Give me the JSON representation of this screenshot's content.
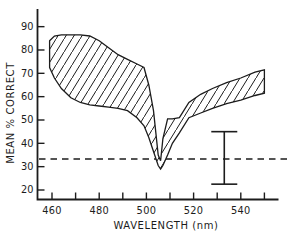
{
  "figure": {
    "background": "#ffffff",
    "ink_color": "#1c1c1c",
    "xlabel": "WAVELENGTH (nm)",
    "ylabel": "MEAN % CORRECT"
  },
  "chart_data": {
    "type": "area",
    "subtype": "hatched-band-between-two-curves",
    "title": "",
    "xlabel": "WAVELENGTH (nm)",
    "ylabel": "MEAN % CORRECT",
    "x_unit": "nm",
    "y_unit": "percent correct",
    "xlim": [
      454,
      556
    ],
    "ylim": [
      16,
      97
    ],
    "grid": "off",
    "x_ticks": [
      460,
      470,
      480,
      490,
      500,
      510,
      520,
      530,
      540,
      550
    ],
    "x_tick_labels": [
      460,
      480,
      500,
      520,
      540
    ],
    "y_ticks": [
      20,
      30,
      40,
      50,
      60,
      70,
      80,
      90
    ],
    "band": {
      "description": "hatched region between upper and lower percent-correct curves",
      "hatch_direction": "forward-slash",
      "x": [
        459,
        461,
        464,
        468,
        472,
        476,
        480,
        484,
        488,
        492,
        496,
        499,
        501,
        503,
        505,
        506,
        507,
        509,
        511,
        514,
        518,
        523,
        528,
        534,
        540,
        546,
        550
      ],
      "upper": [
        84,
        86,
        86.5,
        86.5,
        86.5,
        86,
        84,
        81,
        78,
        76,
        74,
        72.5,
        65,
        54,
        35,
        32.5,
        42,
        50.5,
        50.5,
        51,
        57.5,
        61,
        63.5,
        66,
        68,
        70.5,
        71.5
      ],
      "lower": [
        72.5,
        68,
        63.5,
        59.5,
        57.5,
        56.5,
        56,
        55.5,
        55,
        54,
        51,
        47.5,
        42.5,
        36.5,
        30.5,
        29,
        30.5,
        35,
        40,
        44.5,
        51,
        53,
        55,
        57,
        58.5,
        60.5,
        61.5
      ]
    },
    "dashed_reference_line": {
      "y": 33.3,
      "style": "dashed",
      "meaning": "chance level"
    },
    "error_bar": {
      "x": 533,
      "y_top": 45,
      "y_bottom": 22.5
    }
  }
}
